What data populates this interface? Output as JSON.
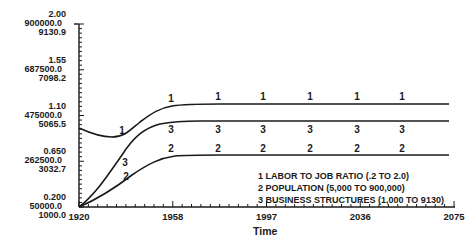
{
  "chart_data": {
    "type": "line",
    "title": "",
    "xlabel": "Time",
    "ylabel": "",
    "x_ticks": [
      "1920",
      "1958",
      "1997",
      "2036",
      "2075"
    ],
    "xlim": [
      1920,
      2075
    ],
    "y_axes": [
      {
        "series": "LABOR TO JOB RATIO",
        "ticks": [
          "0.200",
          "0.650",
          "1.10",
          "1.55",
          "2.00"
        ],
        "range": [
          0.2,
          2.0
        ]
      },
      {
        "series": "POPULATION",
        "ticks": [
          "50000.0",
          "262500.0",
          "475000.0",
          "687500.0",
          "900000.0"
        ],
        "range": [
          50000,
          900000
        ]
      },
      {
        "series": "BUSINESS STRUCTURES",
        "ticks": [
          "1000.0",
          "3032.7",
          "5065.5",
          "7098.2",
          "9130.9"
        ],
        "range": [
          1000,
          9130.9
        ]
      }
    ],
    "grid": false,
    "legend_position": "lower-right inside plot",
    "x": [
      1920,
      1930,
      1940,
      1950,
      1958,
      1970,
      1997,
      2036,
      2075
    ],
    "series": [
      {
        "name": "LABOR TO JOB RATIO (.2 TO 2.0)",
        "marker": "1",
        "values": [
          0.98,
          0.9,
          0.91,
          1.03,
          1.09,
          1.11,
          1.11,
          1.11,
          1.11
        ]
      },
      {
        "name": "POPULATION (5,000 TO 900,000)",
        "marker": "2",
        "values": [
          50000,
          110000,
          175000,
          240000,
          270000,
          280000,
          280000,
          280000,
          280000
        ]
      },
      {
        "name": "BUSINESS STRUCTURES (1,000 TO 9130)",
        "marker": "3",
        "values": [
          1000,
          2600,
          3900,
          4600,
          4860,
          4920,
          4920,
          4920,
          4920
        ]
      }
    ]
  },
  "axis": {
    "y_groups": [
      [
        "2.00",
        "900000.0",
        "9130.9"
      ],
      [
        "1.55",
        "687500.0",
        "7098.2"
      ],
      [
        "1.10",
        "475000.0",
        "5065.5"
      ],
      [
        "0.650",
        "262500.0",
        "3032.7"
      ],
      [
        "0.200",
        "50000.0",
        "1000.0"
      ]
    ],
    "x_ticks": [
      "1920",
      "1958",
      "1997",
      "2036",
      "2075"
    ],
    "x_title": "Time"
  },
  "legend": [
    "1  LABOR TO  JOB RATIO  (.2  TO 2.0)",
    "2  POPULATION  (5,000 TO 900,000)",
    "3  BUSINESS STRUCTURES (1,000 TO 9130)"
  ],
  "markers": {
    "s1": "1",
    "s2": "2",
    "s3": "3"
  }
}
